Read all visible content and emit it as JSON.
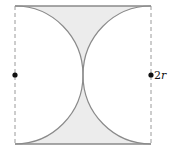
{
  "diagram": {
    "type": "geometry",
    "labels": {
      "right_side": "2r"
    },
    "colors": {
      "shade": "#ececec",
      "arc": "#8a8a8a",
      "solid_edge": "#8a8a8a",
      "dashed_edge": "#9a9a9a",
      "point": "#111111"
    }
  }
}
